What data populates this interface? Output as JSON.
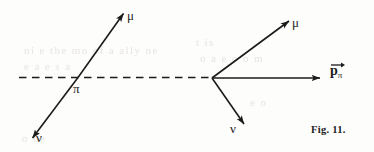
{
  "figure": {
    "caption": "Fig. 11.",
    "ink_color": "#1b1b1b",
    "background_color": "#fdfdfc",
    "ghost_color": "#e7e5e2"
  },
  "left_diagram": {
    "name": "pion-decay-lab-frame",
    "dashed_axis_label": "",
    "vertex_label": "π",
    "muon_label": "μ",
    "neutrino_label": "ν"
  },
  "right_diagram": {
    "name": "pion-momentum-vector-triangle",
    "muon_label": "μ",
    "neutrino_label": "ν",
    "momentum_label_body": "p",
    "momentum_label_subscript": "π"
  },
  "ghost_lines": [
    {
      "text": "ni e the mo of a ally ne",
      "x": 24,
      "y": 44
    },
    {
      "text": "e a    e   s a",
      "x": 24,
      "y": 60
    },
    {
      "text": "t is",
      "x": 196,
      "y": 36
    },
    {
      "text": "o    a e o    o m",
      "x": 200,
      "y": 52
    },
    {
      "text": "e o",
      "x": 250,
      "y": 96
    },
    {
      "text": "o  ne",
      "x": 22,
      "y": 132
    }
  ]
}
